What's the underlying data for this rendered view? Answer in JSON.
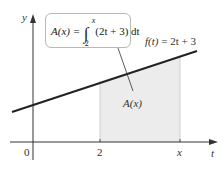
{
  "diagram": {
    "type": "definite-integral-area-function",
    "axes": {
      "x_label": "t",
      "y_label": "y",
      "origin_label": "0",
      "x_ticks": [
        {
          "label": "2",
          "value": 2
        },
        {
          "label": "x",
          "value": "x"
        }
      ]
    },
    "function_label": {
      "lhs": "f(t)",
      "rhs": "= 2t + 3"
    },
    "callout": {
      "lhs": "A(x) =",
      "integrand": "(2t + 3) dt",
      "lower_limit": "2",
      "upper_limit": "x"
    },
    "region_label": "A(x)",
    "colors": {
      "line": "#222222",
      "axis": "#333333",
      "shade": "#ececec",
      "callout_border": "#b8b8b8"
    }
  }
}
